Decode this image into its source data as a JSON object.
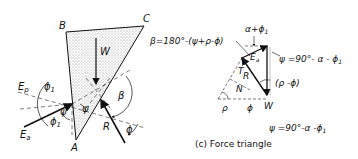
{
  "wedge": {
    "labels": {
      "A": "A",
      "B": "B",
      "C": "C",
      "W": "W",
      "R": "R",
      "Ep": "E",
      "Ep_sub": "p",
      "Ea": "E",
      "Ea_sub": "a"
    },
    "angles": {
      "phi1_top": "ϕ",
      "phi1_top_sub": "1",
      "phi1_bot": "ϕ",
      "phi1_bot_sub": "1",
      "psi_left": "ψ",
      "psi_mid": "ψ",
      "beta": "β",
      "phi_right": "ϕ"
    }
  },
  "equations": {
    "beta": "β=180°-(ψ+ρ-ϕ)",
    "psi_top": "ψ =90°- α - ϕ",
    "psi_top_sub": "1",
    "psi_bottom": "ψ =90°-α -ϕ",
    "psi_bottom_sub": "1",
    "alpha_phi": "α+ϕ",
    "alpha_phi_sub": "1"
  },
  "force_triangle": {
    "labels": {
      "T": "T",
      "R": "R",
      "N": "N",
      "W": "W",
      "rho": "ρ",
      "phi": "ϕ",
      "Ea": "E",
      "Ea_sub": "a",
      "rho_minus_phi": "(ρ -ϕ)"
    },
    "caption": "(c) Force triangle"
  },
  "colors": {
    "ink": "#111111",
    "stipple": "#d8d8d8"
  }
}
